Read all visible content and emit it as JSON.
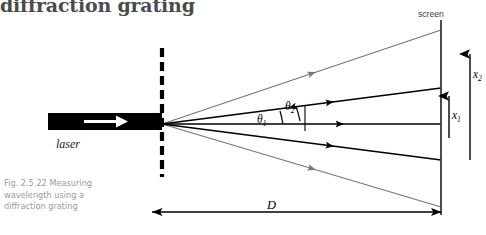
{
  "heading": {
    "text": "diffraction grating",
    "color": "#4b4b4b"
  },
  "caption": {
    "line1": "Fig. 2.5.22 Measuring",
    "line2": "wavelength using a",
    "line3": "diffraction grating",
    "full": "Fig. 2.5.22 Measuring wavelength using a diffraction grating",
    "color": "#9b9b9b"
  },
  "labels": {
    "laser": "laser",
    "screen": "screen",
    "distance": "D",
    "theta1": "θ",
    "theta1_sub": "1",
    "theta2": "θ",
    "theta2_sub": "2",
    "x1": "x",
    "x1_sub": "1",
    "x2": "x",
    "x2_sub": "2"
  },
  "colors": {
    "ray_primary": "#000000",
    "ray_secondary": "#777777",
    "grating": "#000000",
    "screen_line": "#3a3a3a",
    "laser_body": "#000000",
    "laser_arrow": "#ffffff",
    "dimension_line": "#000000",
    "background": "#ffffff"
  },
  "geometry": {
    "grating_x": 162,
    "source_x": 162,
    "source_y": 124,
    "screen_x": 441,
    "screen_top_y": 20,
    "screen_bottom_y": 215,
    "grating_top_y": 48,
    "grating_bottom_y": 177,
    "distance_line_y": 212,
    "order0_end_y": 124,
    "order1_up_end_y": 88,
    "order1_down_end_y": 160,
    "order2_up_end_y": 30,
    "order2_down_end_y": 207,
    "x1_arrow_top_y": 94,
    "x1_arrow_bottom_y": 138,
    "x2_arrow_top_y": 52,
    "x2_arrow_bottom_y": 160
  },
  "physics": {
    "orders": [
      {
        "order": 2,
        "direction": "up",
        "color": "#777777",
        "label": null
      },
      {
        "order": 1,
        "direction": "up",
        "color": "#000000",
        "label": "θ1"
      },
      {
        "order": 0,
        "direction": "straight",
        "color": "#000000",
        "label": null
      },
      {
        "order": 1,
        "direction": "down",
        "color": "#000000",
        "label": null
      },
      {
        "order": 2,
        "direction": "down",
        "color": "#777777",
        "label": null
      }
    ]
  }
}
